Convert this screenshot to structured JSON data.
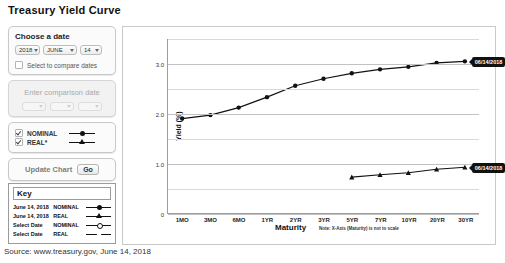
{
  "page": {
    "title": "Treasury Yield Curve",
    "source": "Source: www.treasury.gov, June 14, 2018"
  },
  "controls": {
    "date_panel": {
      "heading": "Choose a date",
      "year": "2018",
      "month": "JUNE",
      "day": "14",
      "compare_checkbox_label": "Select to compare dates"
    },
    "comparison_panel": {
      "placeholder": "Enter comparison date"
    },
    "series_panel": {
      "nominal_label": "NOMINAL",
      "real_label": "REAL*"
    },
    "update": {
      "label": "Update Chart",
      "go_label": "Go"
    }
  },
  "key": {
    "heading": "Key",
    "rows": [
      {
        "date": "June 14, 2018",
        "type": "NOMINAL",
        "marker": "filled-circle"
      },
      {
        "date": "June 14, 2018",
        "type": "REAL",
        "marker": "filled-triangle"
      },
      {
        "date": "Select Date",
        "type": "NOMINAL",
        "marker": "open-circle"
      },
      {
        "date": "Select Date",
        "type": "REAL",
        "marker": "open-triangle"
      }
    ]
  },
  "chart_data": {
    "type": "line",
    "title": "Treasury Yield Curve",
    "xlabel": "Maturity",
    "ylabel": "Yield (%)",
    "note": "Note: X-Axis (Maturity) is not to scale",
    "categories": [
      "1MO",
      "3MO",
      "6MO",
      "1YR",
      "2YR",
      "3YR",
      "5YR",
      "7YR",
      "10YR",
      "20YR",
      "30YR"
    ],
    "ylim": [
      0,
      3.5
    ],
    "yticks": [
      "0",
      "1.0",
      "2.0",
      "3.0"
    ],
    "ytick_values": [
      0,
      1.0,
      2.0,
      3.0
    ],
    "minor_gridlines": [
      0.5,
      1.5,
      2.5,
      3.5
    ],
    "grid": true,
    "legend_position": "external-key-box",
    "series": [
      {
        "name": "June 14, 2018 NOMINAL",
        "marker": "filled-circle",
        "values": [
          1.9,
          1.97,
          2.12,
          2.33,
          2.56,
          2.7,
          2.81,
          2.89,
          2.94,
          3.02,
          3.05
        ],
        "annotation": "06/14/2018"
      },
      {
        "name": "June 14, 2018 REAL",
        "marker": "filled-triangle",
        "values": [
          null,
          null,
          null,
          null,
          null,
          null,
          0.72,
          0.77,
          0.81,
          0.88,
          0.92
        ],
        "annotation": "06/14/2018"
      }
    ]
  },
  "annotations": {
    "nominal_tip": "06/14/2018",
    "real_tip": "06/14/2018"
  }
}
